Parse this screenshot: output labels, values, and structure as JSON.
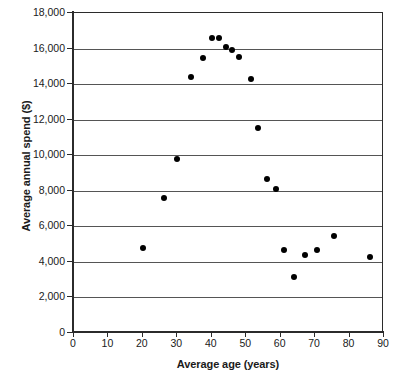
{
  "chart_data": {
    "type": "scatter",
    "title": "",
    "xlabel": "Average age (years)",
    "ylabel": "Average annual spend ($)",
    "xlim": [
      0,
      90
    ],
    "ylim": [
      0,
      18000
    ],
    "xticks": [
      0,
      10,
      20,
      30,
      40,
      50,
      60,
      70,
      80,
      90
    ],
    "xtick_labels": [
      "0",
      "10",
      "20",
      "30",
      "40",
      "50",
      "60",
      "70",
      "80",
      "90"
    ],
    "yticks": [
      0,
      2000,
      4000,
      6000,
      8000,
      10000,
      12000,
      14000,
      16000,
      18000
    ],
    "ytick_labels": [
      "0",
      "2,000",
      "4,000",
      "6,000",
      "8,000",
      "10,000",
      "12,000",
      "14,000",
      "16,000",
      "18,000"
    ],
    "grid": "horizontal",
    "legend": "none",
    "marker": "filled-circle",
    "marker_color": "#000000",
    "series": [
      {
        "name": "Average annual spend by average age",
        "points": [
          {
            "x": 20,
            "y": 4800
          },
          {
            "x": 26,
            "y": 7600
          },
          {
            "x": 30,
            "y": 9800
          },
          {
            "x": 34,
            "y": 14400
          },
          {
            "x": 37.5,
            "y": 15450
          },
          {
            "x": 40,
            "y": 16600
          },
          {
            "x": 42,
            "y": 16600
          },
          {
            "x": 44,
            "y": 16100
          },
          {
            "x": 46,
            "y": 15900
          },
          {
            "x": 48,
            "y": 15550
          },
          {
            "x": 51.5,
            "y": 14300
          },
          {
            "x": 53.5,
            "y": 11550
          },
          {
            "x": 56,
            "y": 8650
          },
          {
            "x": 58.5,
            "y": 8100
          },
          {
            "x": 61,
            "y": 4650
          },
          {
            "x": 64,
            "y": 3150
          },
          {
            "x": 67,
            "y": 4400
          },
          {
            "x": 70.5,
            "y": 4650
          },
          {
            "x": 75.5,
            "y": 5450
          },
          {
            "x": 86,
            "y": 4300
          }
        ]
      }
    ]
  }
}
